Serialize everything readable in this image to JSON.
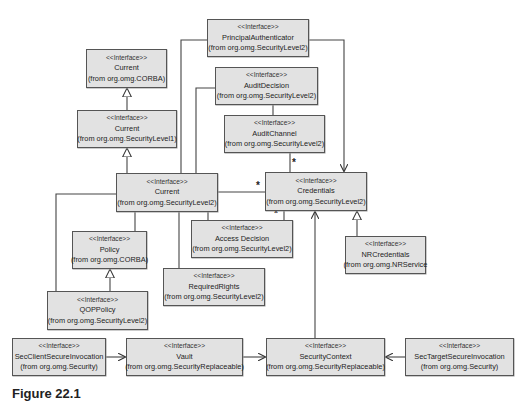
{
  "diagram": {
    "type": "UML class diagram",
    "stereotype": "<<Interface>>",
    "classes": [
      {
        "id": "principal_authenticator",
        "name": "PrincipalAuthenticator",
        "package": "(from org.omg.SecurityLevel2)"
      },
      {
        "id": "current_corba",
        "name": "Current",
        "package": "(from org.omg.CORBA)"
      },
      {
        "id": "audit_decision",
        "name": "AuditDecision",
        "package": "(from org.omg.SecurityLevel2)"
      },
      {
        "id": "current_sl1",
        "name": "Current",
        "package": "(from org.omg.SecurityLevel1)"
      },
      {
        "id": "audit_channel",
        "name": "AuditChannel",
        "package": "(from org.omg.SecurityLevel2)"
      },
      {
        "id": "current_sl2",
        "name": "Current",
        "package": "(from org.omg.SecurityLevel2)"
      },
      {
        "id": "credentials",
        "name": "Credentials",
        "package": "(from org.omg.SecurityLevel2)"
      },
      {
        "id": "policy",
        "name": "Policy",
        "package": "(from org.omg.CORBA)"
      },
      {
        "id": "access_decision",
        "name": "Access Decision",
        "package": "(from org.omg.SecurityLevel2)"
      },
      {
        "id": "nr_credentials",
        "name": "NRCredentials",
        "package": "(from org.omg.NRService"
      },
      {
        "id": "required_rights",
        "name": "RequiredRights",
        "package": "(from org.omg.SecurityLevel2)"
      },
      {
        "id": "qop_policy",
        "name": "QOPPolicy",
        "package": "(from org.omg.SecurityLevel2)"
      },
      {
        "id": "sec_client",
        "name": "SecClientSecureInvocation",
        "package": "(from org.omg.Security)"
      },
      {
        "id": "vault",
        "name": "Vault",
        "package": "(from org.omg.SecurityReplaceable)"
      },
      {
        "id": "security_context",
        "name": "SecurityContext",
        "package": "(from org.omg.SecurityReplaceable)"
      },
      {
        "id": "sec_target",
        "name": "SecTargetSecureInvocation",
        "package": "(from org.omg.Security)"
      }
    ],
    "relations": [
      {
        "from": "current_sl1",
        "to": "current_corba",
        "kind": "generalization"
      },
      {
        "from": "current_sl2",
        "to": "current_sl1",
        "kind": "generalization"
      },
      {
        "from": "qop_policy",
        "to": "policy",
        "kind": "generalization"
      },
      {
        "from": "nr_credentials",
        "to": "credentials",
        "kind": "generalization"
      },
      {
        "from": "principal_authenticator",
        "to": "credentials",
        "kind": "dependency"
      },
      {
        "from": "principal_authenticator",
        "to": "current_sl2",
        "kind": "association"
      },
      {
        "from": "audit_decision",
        "to": "current_sl2",
        "kind": "association"
      },
      {
        "from": "audit_decision",
        "to": "audit_channel",
        "kind": "association"
      },
      {
        "from": "audit_channel",
        "to": "credentials",
        "kind": "association",
        "multiplicity": "*"
      },
      {
        "from": "current_sl2",
        "to": "credentials",
        "kind": "association",
        "multiplicity": "*"
      },
      {
        "from": "access_decision",
        "to": "credentials",
        "kind": "association",
        "multiplicity": "*"
      },
      {
        "from": "current_sl2",
        "to": "policy",
        "kind": "association"
      },
      {
        "from": "current_sl2",
        "to": "required_rights",
        "kind": "association"
      },
      {
        "from": "current_sl2",
        "to": "qop_policy",
        "kind": "association"
      },
      {
        "from": "security_context",
        "to": "credentials",
        "kind": "dependency"
      },
      {
        "from": "sec_client",
        "to": "vault",
        "kind": "dependency"
      },
      {
        "from": "vault",
        "to": "security_context",
        "kind": "dependency"
      },
      {
        "from": "sec_target",
        "to": "security_context",
        "kind": "dependency"
      }
    ],
    "multiplicity_label": "*"
  },
  "caption": "Figure 22.1"
}
